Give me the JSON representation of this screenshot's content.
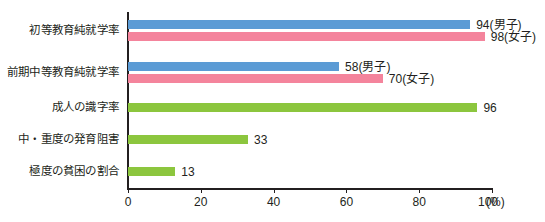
{
  "chart_data": {
    "type": "bar",
    "orientation": "horizontal",
    "title": "",
    "xlabel": "(%)",
    "ylabel": "",
    "xlim": [
      0,
      100
    ],
    "xticks": [
      0,
      20,
      40,
      60,
      80,
      100
    ],
    "xtick_labels": [
      "0",
      "20",
      "40",
      "60",
      "80",
      "100"
    ],
    "x_unit_label": "(%)",
    "grid": false,
    "legend": "none",
    "categories": [
      "初等教育純就学率",
      "前期中等教育純就学率",
      "成人の識字率",
      "中・重度の発育阻害",
      "極度の貧困の割合"
    ],
    "series": [
      {
        "name": "男子",
        "color": "#5b9bd5",
        "values": [
          94,
          58,
          null,
          null,
          null
        ]
      },
      {
        "name": "女子",
        "color": "#f4849c",
        "values": [
          98,
          70,
          null,
          null,
          null
        ]
      },
      {
        "name": "全体",
        "color": "#8cc63e",
        "values": [
          null,
          null,
          96,
          33,
          13
        ]
      }
    ],
    "bars": [
      {
        "category": "初等教育純就学率",
        "row": 0,
        "items": [
          {
            "value": 94,
            "label": "94(男子)",
            "color": "#5b9bd5",
            "series": "男子"
          },
          {
            "value": 98,
            "label": "98(女子)",
            "color": "#f4849c",
            "series": "女子"
          }
        ]
      },
      {
        "category": "前期中等教育純就学率",
        "row": 1,
        "items": [
          {
            "value": 58,
            "label": "58(男子)",
            "color": "#5b9bd5",
            "series": "男子"
          },
          {
            "value": 70,
            "label": "70(女子)",
            "color": "#f4849c",
            "series": "女子"
          }
        ]
      },
      {
        "category": "成人の識字率",
        "row": 2,
        "items": [
          {
            "value": 96,
            "label": "96",
            "color": "#8cc63e",
            "series": "全体"
          }
        ]
      },
      {
        "category": "中・重度の発育阻害",
        "row": 3,
        "items": [
          {
            "value": 33,
            "label": "33",
            "color": "#8cc63e",
            "series": "全体"
          }
        ]
      },
      {
        "category": "極度の貧困の割合",
        "row": 4,
        "items": [
          {
            "value": 13,
            "label": "13",
            "color": "#8cc63e",
            "series": "全体"
          }
        ]
      }
    ],
    "colors": {
      "male": "#5b9bd5",
      "female": "#f4849c",
      "overall": "#8cc63e",
      "axis": "#231f20",
      "text": "#231f20",
      "background": "#ffffff"
    }
  }
}
